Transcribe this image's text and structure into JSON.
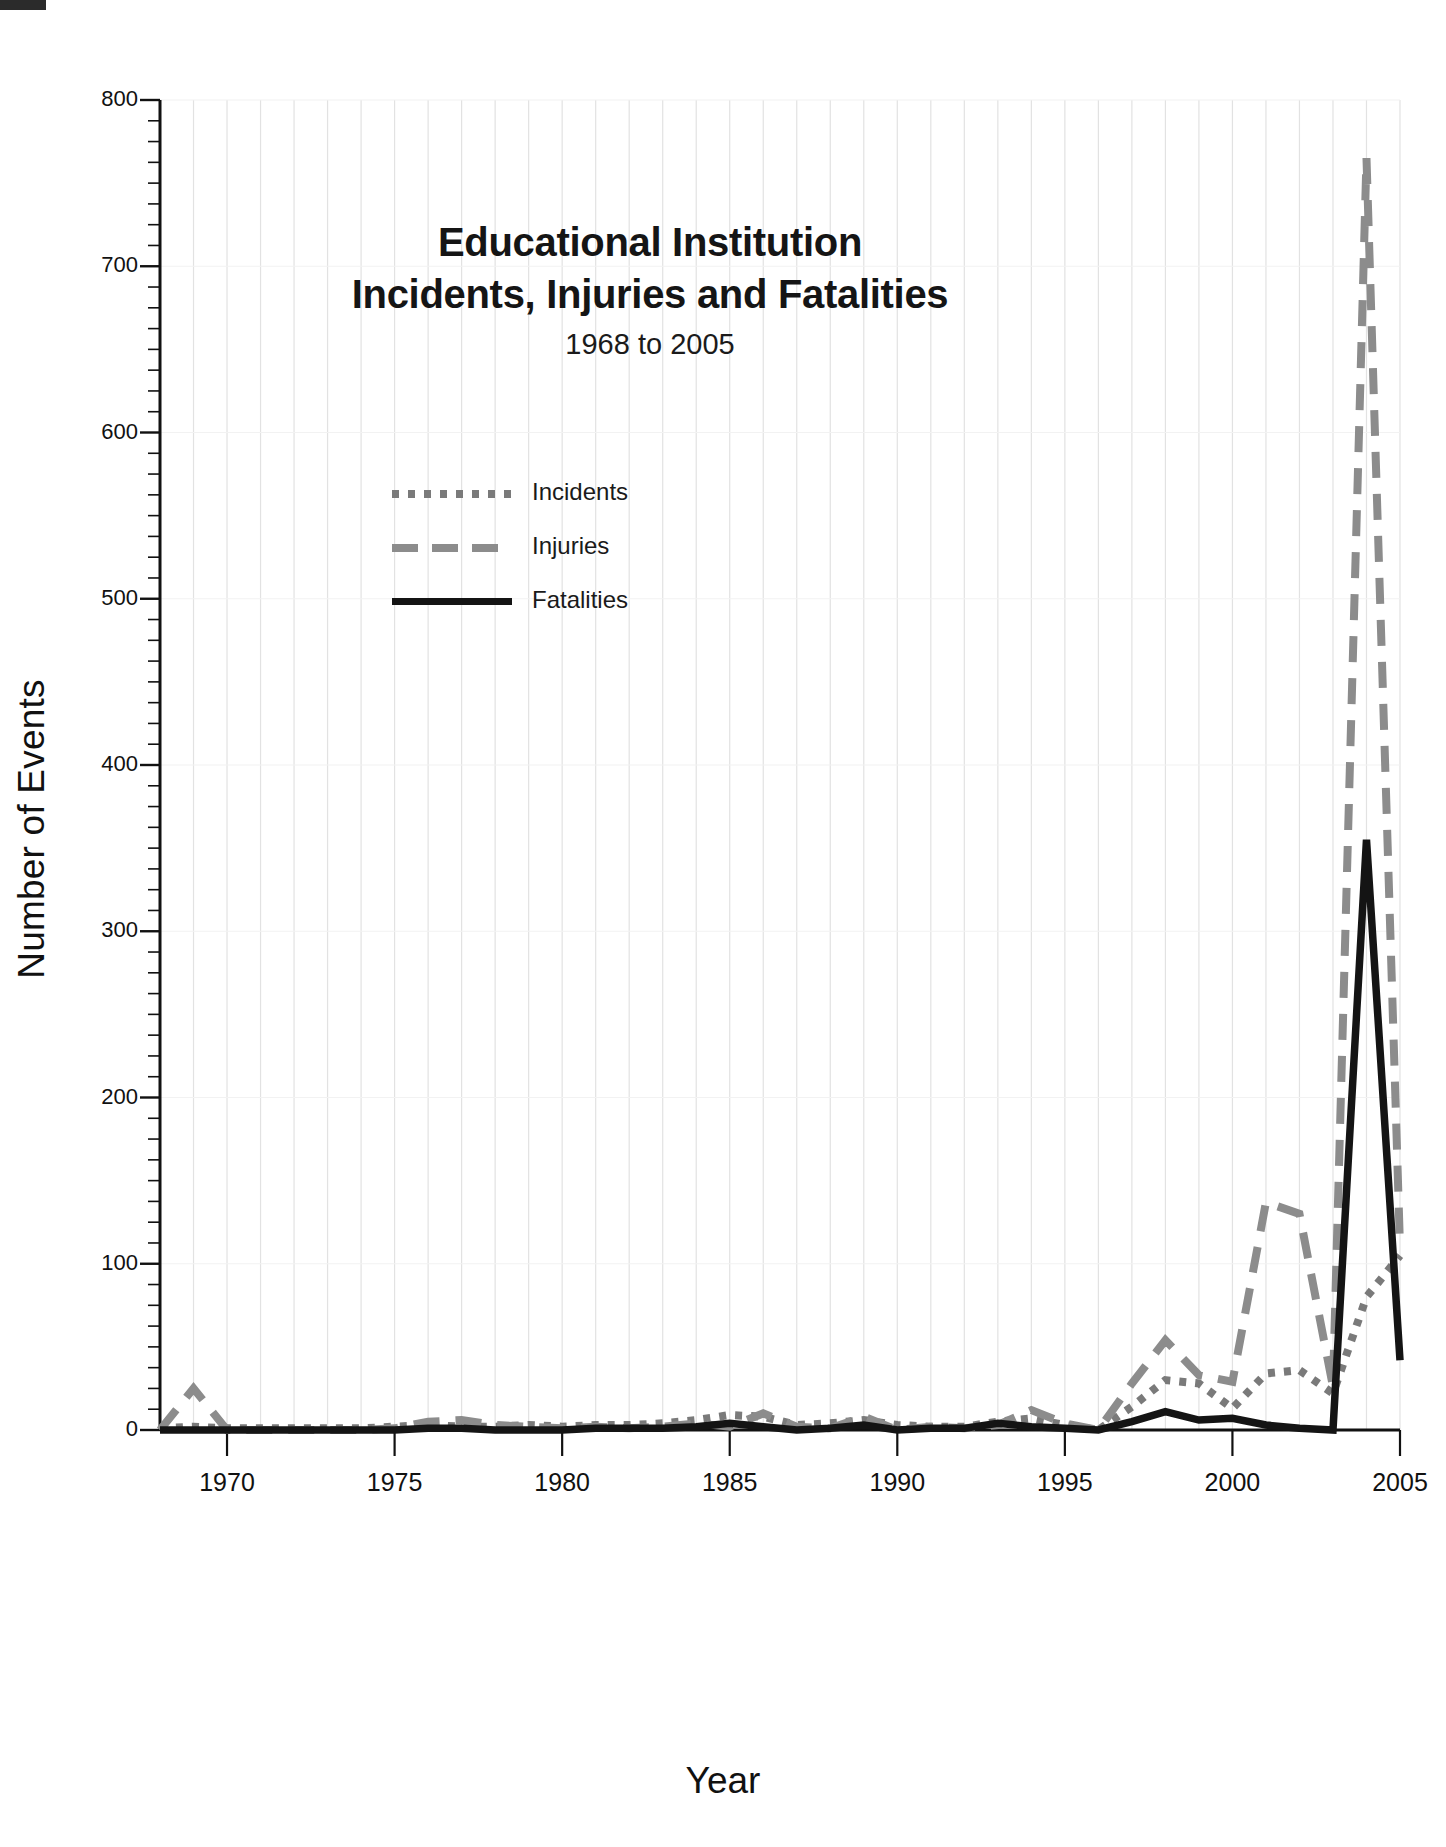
{
  "chart_data": {
    "type": "line",
    "title_line1": "Educational Institution",
    "title_line2": "Incidents, Injuries and Fatalities",
    "subtitle": "1968 to 2005",
    "xlabel": "Year",
    "ylabel": "Number of Events",
    "xlim": [
      1968,
      2005
    ],
    "ylim": [
      0,
      800
    ],
    "grid": "vertical gridlines each year; faint horizontal lines at every 100",
    "legend_position": "upper-left-inside",
    "y_major_ticks": [
      0,
      100,
      200,
      300,
      400,
      500,
      600,
      700,
      800
    ],
    "y_tick_labels": [
      "0",
      "100",
      "200",
      "300",
      "400",
      "500",
      "600",
      "700",
      "800"
    ],
    "y_minor_tick_step": 12.5,
    "x_major_ticks": [
      1970,
      1975,
      1980,
      1985,
      1990,
      1995,
      2000,
      2005
    ],
    "x_tick_labels": [
      "1970",
      "1975",
      "1980",
      "1985",
      "1990",
      "1995",
      "2000",
      "2005"
    ],
    "x": [
      1968,
      1969,
      1970,
      1971,
      1972,
      1973,
      1974,
      1975,
      1976,
      1977,
      1978,
      1979,
      1980,
      1981,
      1982,
      1983,
      1984,
      1985,
      1986,
      1987,
      1988,
      1989,
      1990,
      1991,
      1992,
      1993,
      1994,
      1995,
      1996,
      1997,
      1998,
      1999,
      2000,
      2001,
      2002,
      2003,
      2004,
      2005
    ],
    "series": [
      {
        "name": "Incidents",
        "style": "dotted",
        "color": "#7a7a7a",
        "values": [
          1,
          2,
          1,
          1,
          1,
          1,
          1,
          2,
          3,
          2,
          2,
          3,
          2,
          3,
          3,
          4,
          6,
          9,
          8,
          3,
          4,
          6,
          3,
          2,
          2,
          5,
          7,
          3,
          0,
          14,
          30,
          28,
          13,
          34,
          36,
          22,
          80,
          105
        ]
      },
      {
        "name": "Injuries",
        "style": "dashed",
        "color": "#8c8c8c",
        "values": [
          0,
          25,
          0,
          0,
          0,
          0,
          0,
          1,
          5,
          6,
          3,
          2,
          1,
          2,
          1,
          2,
          4,
          2,
          10,
          2,
          1,
          8,
          0,
          2,
          1,
          3,
          12,
          4,
          0,
          28,
          54,
          33,
          29,
          137,
          130,
          26,
          765,
          110
        ]
      },
      {
        "name": "Fatalities",
        "style": "solid",
        "color": "#141414",
        "values": [
          0,
          0,
          0,
          0,
          0,
          0,
          0,
          0,
          1,
          1,
          0,
          0,
          0,
          1,
          1,
          1,
          2,
          4,
          2,
          0,
          1,
          3,
          0,
          1,
          1,
          4,
          2,
          1,
          0,
          5,
          11,
          6,
          7,
          3,
          1,
          0,
          355,
          42
        ]
      }
    ],
    "annotations": {
      "peak_year": "2004",
      "peak_injuries": 765,
      "peak_fatalities": 355
    }
  }
}
